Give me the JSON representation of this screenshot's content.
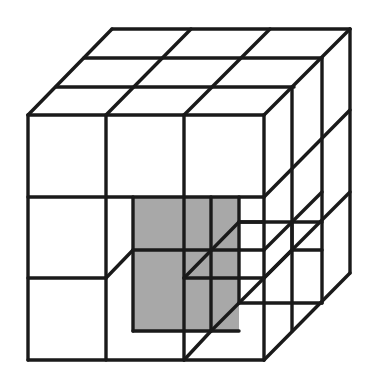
{
  "figure": {
    "width": 372,
    "height": 375,
    "colors": {
      "background": "#ffffff",
      "line": "#1a1a1a",
      "shade": "#a8a8a8"
    },
    "shaded_regions": [
      [
        [
          133,
          198
        ],
        [
          239,
          198
        ],
        [
          239,
          331
        ],
        [
          133,
          331
        ]
      ]
    ],
    "segments": [
      [
        112,
        29,
        350,
        29
      ],
      [
        84,
        58,
        322,
        58
      ],
      [
        56,
        87,
        294,
        87
      ],
      [
        28,
        115,
        264,
        115
      ],
      [
        112,
        29,
        28,
        115
      ],
      [
        191,
        29,
        106,
        115
      ],
      [
        270,
        29,
        184,
        115
      ],
      [
        350,
        29,
        264,
        115
      ],
      [
        28,
        115,
        28,
        360
      ],
      [
        106,
        115,
        106,
        360
      ],
      [
        184,
        115,
        184,
        360
      ],
      [
        264,
        115,
        264,
        360
      ],
      [
        28,
        197,
        264,
        197
      ],
      [
        28,
        278,
        106,
        278
      ],
      [
        28,
        360,
        264,
        360
      ],
      [
        292,
        87,
        292,
        331
      ],
      [
        322,
        58,
        322,
        303
      ],
      [
        350,
        29,
        350,
        273
      ],
      [
        264,
        197,
        350,
        110
      ],
      [
        264,
        278,
        350,
        192
      ],
      [
        264,
        360,
        350,
        273
      ],
      [
        133,
        197,
        133,
        331
      ],
      [
        211,
        197,
        211,
        331
      ],
      [
        239,
        197,
        239,
        250
      ],
      [
        106,
        278,
        133,
        250
      ],
      [
        184,
        278,
        239,
        222
      ],
      [
        184,
        360,
        211,
        331
      ],
      [
        133,
        250,
        264,
        250
      ],
      [
        184,
        278,
        264,
        278
      ],
      [
        133,
        331,
        239,
        331
      ],
      [
        239,
        222,
        322,
        222
      ],
      [
        239,
        250,
        239,
        303
      ],
      [
        239,
        303,
        322,
        303
      ],
      [
        264,
        250,
        322,
        192
      ],
      [
        264,
        278,
        292,
        250
      ],
      [
        211,
        331,
        264,
        278
      ],
      [
        239,
        222,
        264,
        222
      ],
      [
        292,
        250,
        322,
        250
      ],
      [
        292,
        222,
        292,
        250
      ]
    ]
  }
}
